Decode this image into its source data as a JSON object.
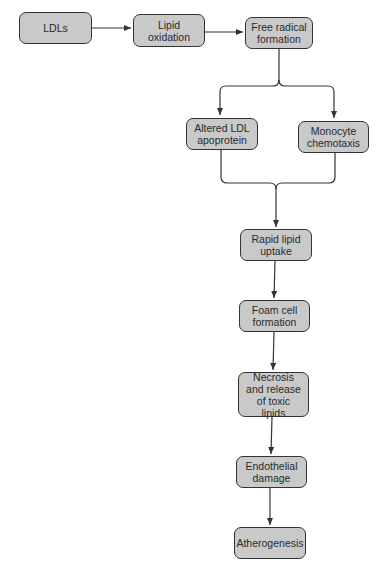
{
  "diagram": {
    "type": "flowchart",
    "colors": {
      "box_fill": "#c9c9c9",
      "box_border": "#333333",
      "line": "#333333",
      "text": "#2a2a2a"
    },
    "nodes": {
      "ldls": "LDLs",
      "lipid_oxidation": "Lipid oxidation",
      "free_radical": "Free radical formation",
      "altered_ldl": "Altered LDL apoprotein",
      "monocyte": "Monocyte chemotaxis",
      "rapid_uptake": "Rapid lipid uptake",
      "foam_cell": "Foam cell formation",
      "necrosis": "Necrosis and release of toxic lipids",
      "endothelial": "Endothelial damage",
      "atherogenesis": "Atherogenesis"
    },
    "edges": [
      [
        "ldls",
        "lipid_oxidation"
      ],
      [
        "lipid_oxidation",
        "free_radical"
      ],
      [
        "free_radical",
        "altered_ldl"
      ],
      [
        "free_radical",
        "monocyte"
      ],
      [
        "altered_ldl",
        "rapid_uptake"
      ],
      [
        "monocyte",
        "rapid_uptake"
      ],
      [
        "rapid_uptake",
        "foam_cell"
      ],
      [
        "foam_cell",
        "necrosis"
      ],
      [
        "necrosis",
        "endothelial"
      ],
      [
        "endothelial",
        "atherogenesis"
      ]
    ]
  }
}
